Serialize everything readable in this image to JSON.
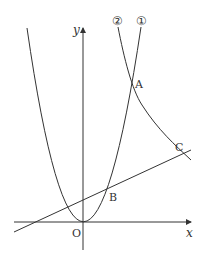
{
  "diagram": {
    "axes": {
      "x_label": "x",
      "y_label": "y",
      "origin_label": "O"
    },
    "curves": [
      {
        "id": "1",
        "label": "①",
        "type": "parabola",
        "description": "parabola through O opening upward"
      },
      {
        "id": "2",
        "label": "②",
        "type": "hyperbola",
        "description": "hyperbola in first quadrant"
      }
    ],
    "line": {
      "description": "straight line crossing parabola at B and hyperbola at C"
    },
    "points": [
      {
        "name": "A",
        "description": "intersection of ① and ②"
      },
      {
        "name": "B",
        "description": "intersection of line and ①"
      },
      {
        "name": "C",
        "description": "intersection of line and ②"
      },
      {
        "name": "O",
        "description": "origin"
      }
    ],
    "colors": {
      "stroke": "#333333",
      "background": "#ffffff"
    }
  }
}
